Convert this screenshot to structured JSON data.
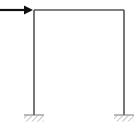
{
  "diagram": {
    "type": "portal-frame",
    "colors": {
      "member": "#555555",
      "load": "#111111",
      "ground": "#777777",
      "background": "#ffffff"
    },
    "load": {
      "direction": "right",
      "icon": "arrow-right-icon"
    },
    "supports": [
      {
        "position": "left",
        "type": "fixed",
        "icon": "fixed-support-icon"
      },
      {
        "position": "right",
        "type": "fixed",
        "icon": "fixed-support-icon"
      }
    ]
  }
}
